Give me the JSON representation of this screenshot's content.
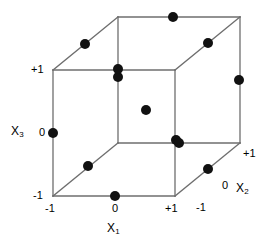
{
  "figure": {
    "type": "3d-cube-design-plot",
    "background_color": "#ffffff",
    "line_color": "#6e6e6e",
    "point_color": "#111111",
    "point_radius": 5
  },
  "axes": {
    "x1": {
      "name": "X",
      "subscript": "1",
      "ticks": [
        "-1",
        "0",
        "+1"
      ]
    },
    "x2": {
      "name": "X",
      "subscript": "2",
      "ticks": [
        "-1",
        "0",
        "+1"
      ]
    },
    "x3": {
      "name": "X",
      "subscript": "3",
      "ticks": [
        "-1",
        "0",
        "+1"
      ]
    }
  },
  "labels": {
    "x3_plus1": "+1",
    "x3_zero": "0",
    "x3_minus1": "-1",
    "x1_minus1": "-1",
    "x1_zero": "0",
    "x1_plus1": "+1",
    "x2_minus1": "-1",
    "x2_zero": "0",
    "x2_plus1": "+1"
  },
  "chart_data": {
    "type": "scatter",
    "title": "",
    "xlabel": "X1",
    "ylabel": "X3",
    "zlabel": "X2",
    "xlim": [
      -1,
      1
    ],
    "ylim": [
      -1,
      1
    ],
    "zlim": [
      -1,
      1
    ],
    "grid": false,
    "legend": null,
    "design": "Box-Behnken (edge midpoints plus center)",
    "n_points": 13,
    "points": [
      {
        "x1": 0,
        "x2": -1,
        "x3": -1,
        "px": 115,
        "py": 196
      },
      {
        "x1": -1,
        "x2": -1,
        "x3": 0,
        "px": 53,
        "py": 133
      },
      {
        "x1": 1,
        "x2": -1,
        "x3": 0,
        "px": 176,
        "py": 140
      },
      {
        "x1": 0,
        "x2": -1,
        "x3": 1,
        "px": 118,
        "py": 77
      },
      {
        "x1": -1,
        "x2": 0,
        "x3": -1,
        "px": 88,
        "py": 166
      },
      {
        "x1": 1,
        "x2": 0,
        "x3": -1,
        "px": 208,
        "py": 169
      },
      {
        "x1": -1,
        "x2": 0,
        "x3": 1,
        "px": 85,
        "py": 44
      },
      {
        "x1": 1,
        "x2": 0,
        "x3": 1,
        "px": 208,
        "py": 43
      },
      {
        "x1": 0,
        "x2": 1,
        "x3": -1,
        "px": 179,
        "py": 143
      },
      {
        "x1": -1,
        "x2": 1,
        "x3": 0,
        "px": 118,
        "py": 69
      },
      {
        "x1": 1,
        "x2": 1,
        "x3": 0,
        "px": 239,
        "py": 80
      },
      {
        "x1": 0,
        "x2": 1,
        "x3": 1,
        "px": 173,
        "py": 17
      },
      {
        "x1": 0,
        "x2": 0,
        "x3": 0,
        "px": 146,
        "py": 110
      }
    ],
    "cube_vertices": {
      "front_bottom_left": [
        53,
        196
      ],
      "front_bottom_right": [
        175,
        196
      ],
      "front_top_left": [
        53,
        70
      ],
      "front_top_right": [
        175,
        70
      ],
      "back_bottom_left": [
        118,
        143
      ],
      "back_bottom_right": [
        240,
        143
      ],
      "back_top_left": [
        118,
        17
      ],
      "back_top_right": [
        240,
        17
      ]
    }
  }
}
